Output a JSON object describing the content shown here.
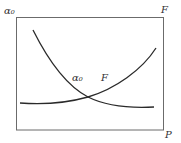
{
  "diagram": {
    "axis_labels": {
      "left_top": "α₀",
      "right_top": "F",
      "bottom_right": "P"
    },
    "curve_labels": {
      "alpha": "α₀",
      "force": "F"
    },
    "curves": [
      {
        "name": "alpha0",
        "description": "decreasing curve, convex, from upper-left to lower-right"
      },
      {
        "name": "F",
        "description": "increasing curve, convex, from lower-left to upper-right"
      }
    ],
    "colors": {
      "frame": "#6b6b6b",
      "curve": "#2a2a2a",
      "text": "#333333"
    }
  }
}
